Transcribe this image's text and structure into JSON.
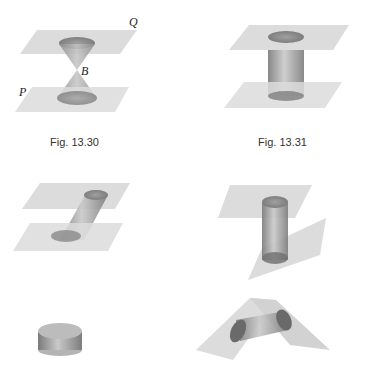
{
  "figures": [
    {
      "id": "fig-13-30",
      "caption": "Fig. 13.30",
      "shape": "double cone between two parallel planes",
      "labels": {
        "top_plane": "Q",
        "bottom_plane": "P",
        "vertex": "B"
      }
    },
    {
      "id": "fig-13-31",
      "caption": "Fig. 13.31",
      "shape": "right cylinder between two parallel planes"
    },
    {
      "id": "oblique-cylinder",
      "caption": "",
      "shape": "oblique cylinder between two parallel planes"
    },
    {
      "id": "truncated-cylinder",
      "caption": "",
      "shape": "cylinder cut by a slanted plane"
    },
    {
      "id": "short-cylinder",
      "caption": "",
      "shape": "short solid cylinder (disc)"
    },
    {
      "id": "wedge-cylinder",
      "caption": "",
      "shape": "cylinder between two intersecting planes"
    }
  ],
  "colors": {
    "plane": "#d9d9d9",
    "solid": "#9a9a9a",
    "solid_dark": "#6f6f6f"
  }
}
